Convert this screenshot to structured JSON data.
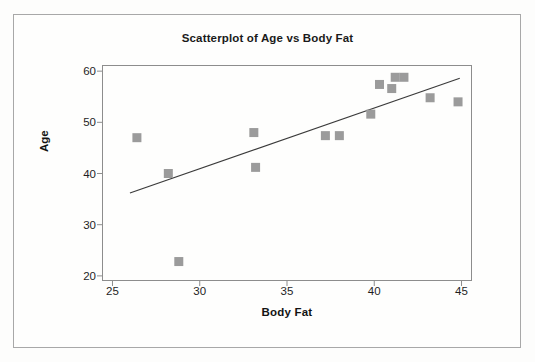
{
  "chart_data": {
    "type": "scatter",
    "title": "Scatterplot of Age vs Body Fat",
    "xlabel": "Body Fat",
    "ylabel": "Age",
    "xlim": [
      24.4,
      45.6
    ],
    "ylim": [
      19.0,
      61.2
    ],
    "xticks": [
      25,
      30,
      35,
      40,
      45
    ],
    "yticks": [
      20,
      30,
      40,
      50,
      60
    ],
    "grid": false,
    "legend": null,
    "marker_color": "#9b9b9b",
    "marker_shape": "square",
    "line_color": "#3a3a3a",
    "frame_color": "#8d8d8d",
    "points": [
      {
        "x": 26.4,
        "y": 47.0
      },
      {
        "x": 28.2,
        "y": 40.0
      },
      {
        "x": 28.8,
        "y": 22.8
      },
      {
        "x": 33.1,
        "y": 48.0
      },
      {
        "x": 33.2,
        "y": 41.2
      },
      {
        "x": 37.2,
        "y": 47.4
      },
      {
        "x": 38.0,
        "y": 47.4
      },
      {
        "x": 39.8,
        "y": 51.6
      },
      {
        "x": 40.3,
        "y": 57.4
      },
      {
        "x": 41.0,
        "y": 56.6
      },
      {
        "x": 41.2,
        "y": 58.8
      },
      {
        "x": 41.7,
        "y": 58.8
      },
      {
        "x": 43.2,
        "y": 54.8
      },
      {
        "x": 44.8,
        "y": 54.0
      }
    ],
    "fit_line": {
      "type": "linear-regression",
      "x_start": 26.0,
      "y_start": 36.2,
      "x_end": 44.9,
      "y_end": 58.6
    }
  }
}
